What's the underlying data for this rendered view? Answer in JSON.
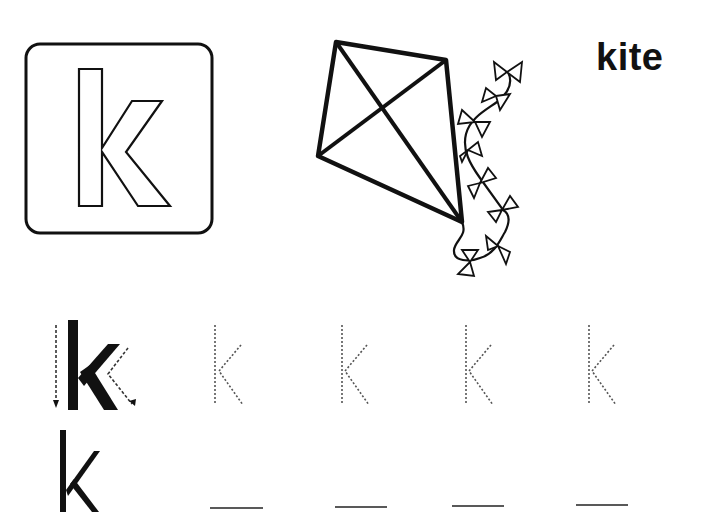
{
  "worksheet": {
    "letter": "k",
    "word": "kite",
    "picture": "kite-with-bow-tail",
    "colors": {
      "ink": "#111111",
      "trace": "#555555",
      "paper": "#ffffff"
    },
    "letter_card": {
      "letter": "k",
      "style": "outlined"
    },
    "trace_row": {
      "model_letter": "k",
      "stroke_guides": [
        "down-stroke-arrow",
        "diagonal-in-out-arrow"
      ],
      "traceable_letters": [
        "k",
        "k",
        "k",
        "k"
      ]
    },
    "write_row": {
      "model_letter": "k",
      "blanks": [
        "",
        "",
        "",
        ""
      ]
    }
  }
}
